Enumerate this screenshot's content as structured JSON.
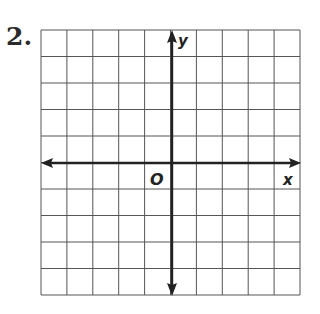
{
  "problem": {
    "number": "2."
  },
  "graph": {
    "grid": {
      "columns": 10,
      "rows": 10,
      "left": 41,
      "top": 30,
      "right": 300,
      "bottom": 295,
      "line_color": "#555555"
    },
    "axes": {
      "x_label": "x",
      "y_label": "y",
      "origin_label": "O",
      "origin_col": 5,
      "origin_row": 5,
      "color": "#222222"
    }
  }
}
